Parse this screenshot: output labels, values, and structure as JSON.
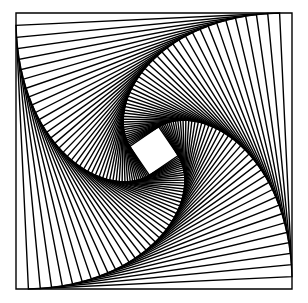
{
  "artwork": {
    "title": "Nested rotating squares spiral",
    "outer_square": {
      "x": 16,
      "y": 13,
      "size": 276
    },
    "step_fraction": 0.045,
    "iterations": 46,
    "stroke_color": "#000000",
    "stroke_width": 1.4,
    "background_color": "#ffffff",
    "rotation_direction": "counterclockwise"
  }
}
